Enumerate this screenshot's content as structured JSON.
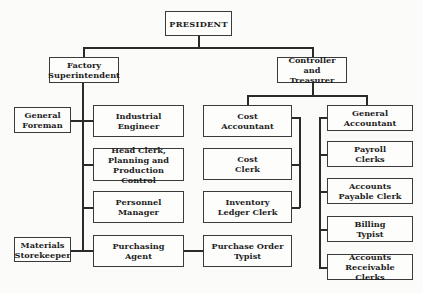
{
  "nodes": {
    "president": "PRESIDENT",
    "factory_superintendent": "Factory\nSuperintendent",
    "controller_treasurer": "Controller\nand Treasurer",
    "general_foreman": "General\nForeman",
    "industrial_engineer": "Industrial\nEngineer",
    "head_clerk": "Head Clerk,\nPlanning and\nProduction Control",
    "personnel_manager": "Personnel\nManager",
    "materials_storekeeper": "Materials\nStorekeeper",
    "purchasing_agent": "Purchasing\nAgent",
    "cost_accountant": "Cost\nAccountant",
    "cost_clerk": "Cost\nClerk",
    "inventory_ledger_clerk": "Inventory\nLedger Clerk",
    "purchase_order_typist": "Purchase Order\nTypist",
    "general_accountant": "General\nAccountant",
    "payroll_clerks": "Payroll\nClerks",
    "accounts_payable_clerk": "Accounts\nPayable Clerk",
    "billing_typist": "Billing\nTypist",
    "accounts_receivable_clerks": "Accounts\nReceivable Clerks"
  },
  "hierarchy": {
    "President": [
      "Factory Superintendent",
      "Controller and Treasurer"
    ],
    "Factory Superintendent": [
      "General Foreman",
      "Industrial Engineer",
      "Head Clerk, Planning and Production Control",
      "Personnel Manager",
      "Materials Storekeeper",
      "Purchasing Agent"
    ],
    "Purchasing Agent": [
      "Purchase Order Typist"
    ],
    "Controller and Treasurer": [
      "Cost Accountant",
      "General Accountant"
    ],
    "Cost Accountant": [
      "Cost Clerk",
      "Inventory Ledger Clerk"
    ],
    "General Accountant": [
      "Payroll Clerks",
      "Accounts Payable Clerk",
      "Billing Typist",
      "Accounts Receivable Clerks"
    ]
  }
}
